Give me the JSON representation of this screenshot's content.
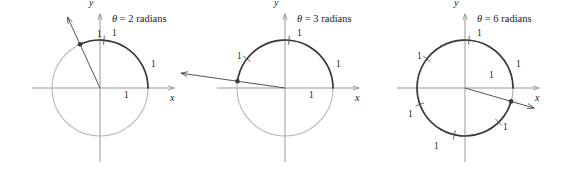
{
  "figure": {
    "colors": {
      "arc_highlight": "#3a3a3a",
      "circle_light": "#b4b4b4",
      "axis": "#8a8a8a",
      "ray": "#4a4a4a",
      "text": "#1a1a1a"
    },
    "panels": [
      {
        "id": "panel-2-radians",
        "angle_value": 2,
        "angle_unit": "radians",
        "caption_symbol": "θ",
        "caption_equals": "=",
        "caption_value": "2",
        "caption_unit": "radians",
        "caption_full": "θ = 2 radians",
        "x_axis_label": "x",
        "y_axis_label": "y",
        "center": {
          "cx": 100,
          "cy": 88
        },
        "radius": 48,
        "arc_start_deg": 0,
        "arc_end_deg": 114.6,
        "terminal_point_deg": 114.6,
        "ray_length": 78,
        "tick_angles_deg": [
          57.3
        ],
        "unit_labels": [
          {
            "text": "1",
            "x": 112,
            "y": 29
          },
          {
            "text": "1",
            "x": 151,
            "y": 60
          },
          {
            "text": "1",
            "x": 124,
            "y": 91
          },
          {
            "text": "1",
            "x": 97,
            "y": 30
          }
        ]
      },
      {
        "id": "panel-3-radians",
        "angle_value": 3,
        "angle_unit": "radians",
        "caption_symbol": "θ",
        "caption_equals": "=",
        "caption_value": "3",
        "caption_unit": "radians",
        "caption_full": "θ = 3 radians",
        "x_axis_label": "x",
        "y_axis_label": "y",
        "center": {
          "cx": 100,
          "cy": 88
        },
        "radius": 48,
        "arc_start_deg": 0,
        "arc_end_deg": 171.9,
        "terminal_point_deg": 171.9,
        "ray_length": 105,
        "tick_angles_deg": [
          57.3,
          114.6
        ],
        "unit_labels": [
          {
            "text": "1",
            "x": 112,
            "y": 29
          },
          {
            "text": "1",
            "x": 151,
            "y": 60
          },
          {
            "text": "1",
            "x": 124,
            "y": 91
          },
          {
            "text": "1",
            "x": 52,
            "y": 52
          }
        ]
      },
      {
        "id": "panel-6-radians",
        "angle_value": 6,
        "angle_unit": "radians",
        "caption_symbol": "θ",
        "caption_equals": "=",
        "caption_value": "6",
        "caption_unit": "radians",
        "caption_full": "θ = 6 radians",
        "x_axis_label": "x",
        "y_axis_label": "y",
        "center": {
          "cx": 95,
          "cy": 88
        },
        "radius": 48,
        "arc_start_deg": 0,
        "arc_end_deg": 343.8,
        "terminal_point_deg": -16.2,
        "ray_length": 72,
        "tick_angles_deg": [
          57.3,
          114.6,
          171.9,
          229.2,
          286.5
        ],
        "unit_labels": [
          {
            "text": "1",
            "x": 107,
            "y": 29
          },
          {
            "text": "1",
            "x": 146,
            "y": 60
          },
          {
            "text": "1",
            "x": 119,
            "y": 71
          },
          {
            "text": "1",
            "x": 47,
            "y": 52
          },
          {
            "text": "1",
            "x": 38,
            "y": 110
          },
          {
            "text": "1",
            "x": 64,
            "y": 142
          },
          {
            "text": "1",
            "x": 133,
            "y": 123
          }
        ]
      }
    ]
  }
}
